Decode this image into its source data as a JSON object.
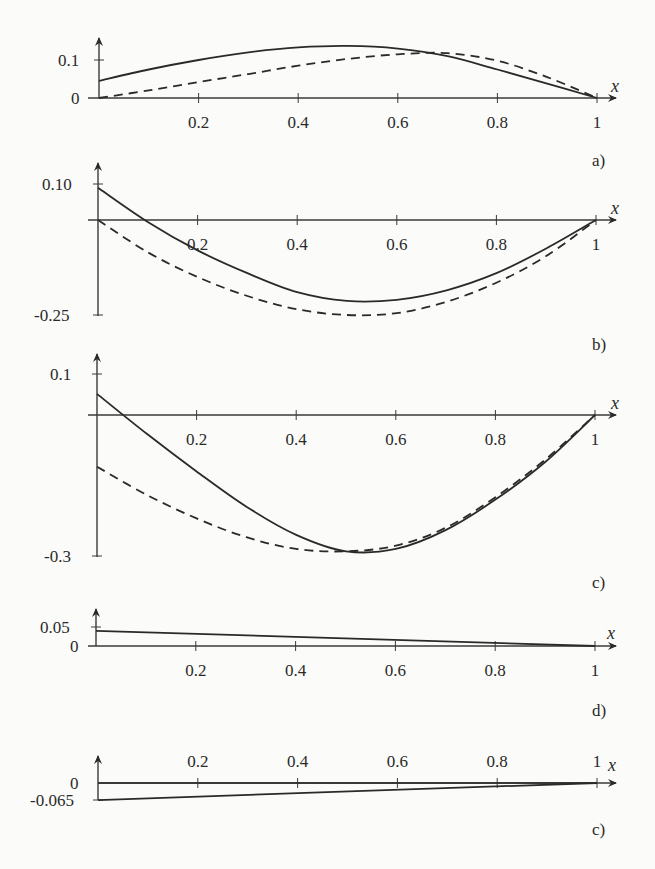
{
  "chart_data": [
    {
      "type": "line",
      "panel_label": "a)",
      "xlabel": "x",
      "ylabel": "",
      "xlim": [
        0,
        1
      ],
      "ylim": [
        0,
        0.1
      ],
      "x_ticks": [
        "0.2",
        "0.4",
        "0.6",
        "0.8",
        "1"
      ],
      "y_ticks": [
        "0",
        "0.1"
      ],
      "x": [
        0,
        0.1,
        0.2,
        0.3,
        0.4,
        0.5,
        0.6,
        0.7,
        0.8,
        0.9,
        1.0
      ],
      "series": [
        {
          "name": "solid",
          "style": "solid",
          "values": [
            0.045,
            0.075,
            0.1,
            0.12,
            0.133,
            0.137,
            0.13,
            0.11,
            0.075,
            0.038,
            0.0
          ]
        },
        {
          "name": "dashed",
          "style": "dashed",
          "values": [
            0.0,
            0.02,
            0.042,
            0.063,
            0.085,
            0.103,
            0.115,
            0.118,
            0.098,
            0.055,
            0.0
          ]
        }
      ]
    },
    {
      "type": "line",
      "panel_label": "b)",
      "xlabel": "x",
      "ylabel": "",
      "xlim": [
        0,
        1
      ],
      "ylim": [
        -0.25,
        0.1
      ],
      "x_ticks": [
        "0.2",
        "0.4",
        "0.6",
        "0.8",
        "1"
      ],
      "y_ticks": [
        "0.10",
        "-0.25"
      ],
      "x": [
        0,
        0.1,
        0.2,
        0.3,
        0.4,
        0.5,
        0.6,
        0.7,
        0.8,
        0.9,
        1.0
      ],
      "series": [
        {
          "name": "solid",
          "style": "solid",
          "values": [
            0.085,
            -0.005,
            -0.08,
            -0.14,
            -0.19,
            -0.213,
            -0.21,
            -0.185,
            -0.14,
            -0.075,
            0.0
          ]
        },
        {
          "name": "dashed",
          "style": "dashed",
          "values": [
            0.0,
            -0.085,
            -0.15,
            -0.2,
            -0.235,
            -0.25,
            -0.245,
            -0.215,
            -0.165,
            -0.095,
            0.0
          ]
        }
      ]
    },
    {
      "type": "line",
      "panel_label": "c)",
      "xlabel": "x",
      "ylabel": "",
      "xlim": [
        0,
        1
      ],
      "ylim": [
        -0.3,
        0.1
      ],
      "x_ticks": [
        "0.2",
        "0.4",
        "0.6",
        "0.8",
        "1"
      ],
      "y_ticks": [
        "0.1",
        "-0.3"
      ],
      "x": [
        0,
        0.1,
        0.2,
        0.3,
        0.4,
        0.5,
        0.6,
        0.7,
        0.8,
        0.9,
        1.0
      ],
      "series": [
        {
          "name": "solid",
          "style": "solid",
          "values": [
            0.045,
            -0.04,
            -0.12,
            -0.195,
            -0.255,
            -0.29,
            -0.285,
            -0.245,
            -0.18,
            -0.1,
            0.0
          ]
        },
        {
          "name": "dashed",
          "style": "dashed",
          "values": [
            -0.11,
            -0.17,
            -0.22,
            -0.26,
            -0.285,
            -0.29,
            -0.278,
            -0.24,
            -0.175,
            -0.095,
            0.0
          ]
        }
      ]
    },
    {
      "type": "line",
      "panel_label": "d)",
      "xlabel": "x",
      "ylabel": "",
      "xlim": [
        0,
        1
      ],
      "ylim": [
        0,
        0.05
      ],
      "x_ticks": [
        "0.2",
        "0.4",
        "0.6",
        "0.8",
        "1"
      ],
      "y_ticks": [
        "0",
        "0.05"
      ],
      "x": [
        0,
        1
      ],
      "series": [
        {
          "name": "solid",
          "style": "solid",
          "values": [
            0.04,
            0.0
          ]
        }
      ]
    },
    {
      "type": "line",
      "panel_label": "c)",
      "xlabel": "x",
      "ylabel": "",
      "xlim": [
        0,
        1
      ],
      "ylim": [
        -0.065,
        0
      ],
      "x_ticks": [
        "0.2",
        "0.4",
        "0.6",
        "0.8",
        "1"
      ],
      "y_ticks": [
        "0",
        "-0.065"
      ],
      "x": [
        0,
        1
      ],
      "series": [
        {
          "name": "solid",
          "style": "solid",
          "values": [
            -0.065,
            0.0
          ]
        },
        {
          "name": "solid-near-zero",
          "style": "solid",
          "values": [
            0.0,
            0.0
          ]
        }
      ]
    }
  ],
  "labels": {
    "x": "x",
    "a": {
      "panel": "a)",
      "y_top": "0.1",
      "y_bottom": "0"
    },
    "b": {
      "panel": "b)",
      "y_top": "0.10",
      "y_bottom": "-0.25"
    },
    "c": {
      "panel": "c)",
      "y_top": "0.1",
      "y_bottom": "-0.3"
    },
    "d": {
      "panel": "d)",
      "y_top": "0.05",
      "y_bottom": "0"
    },
    "e": {
      "panel": "c)",
      "y_top": "0",
      "y_bottom": "-0.065"
    },
    "xticks": [
      "0.2",
      "0.4",
      "0.6",
      "0.8",
      "1"
    ]
  }
}
